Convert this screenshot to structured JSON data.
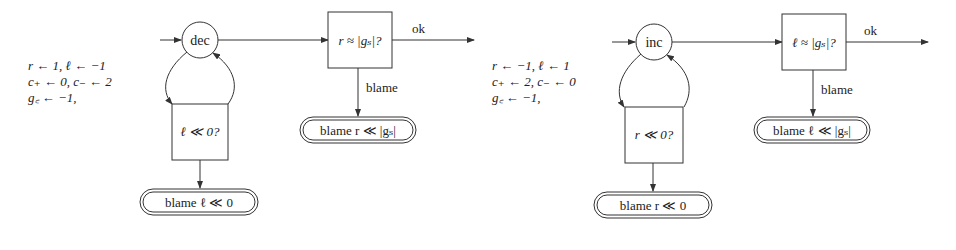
{
  "diagrams": [
    {
      "id": "left",
      "start_state": "dec",
      "check_label": "r ≈ |gₛ|?",
      "ok_label": "ok",
      "blame_edge_label": "blame",
      "blame_terminal_right": "blame r ≪ |gₛ|",
      "loop_check_label": "ℓ ≪ 0?",
      "blame_terminal_bottom": "blame ℓ ≪ 0",
      "init": [
        "r  ←   1, ℓ  ← −1",
        "c₊ ←   0, c₋ ←   2",
        "g꜀ ← −1,"
      ]
    },
    {
      "id": "right",
      "start_state": "inc",
      "check_label": "ℓ ≈ |gₛ|?",
      "ok_label": "ok",
      "blame_edge_label": "blame",
      "blame_terminal_right": "blame ℓ ≪ |gₛ|",
      "loop_check_label": "r ≪ 0?",
      "blame_terminal_bottom": "blame r ≪ 0",
      "init": [
        "r  ← −1, ℓ  ← 1",
        "c₊ ←   2, c₋ ← 0",
        "g꜀ ← −1,"
      ]
    }
  ]
}
